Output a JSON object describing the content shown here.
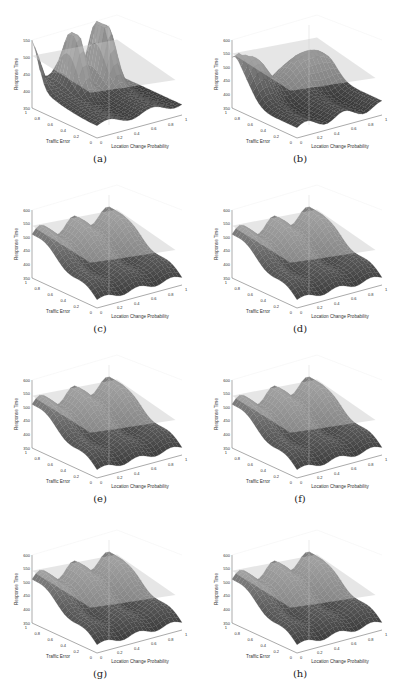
{
  "figure": {
    "panels": [
      {
        "id": "a",
        "caption": "(a)",
        "variant": "two-peaks",
        "x": 0,
        "y": 0
      },
      {
        "id": "b",
        "caption": "(b)",
        "variant": "ridge",
        "x": 200,
        "y": 0
      },
      {
        "id": "c",
        "caption": "(c)",
        "variant": "wavy",
        "x": 0,
        "y": 170
      },
      {
        "id": "d",
        "caption": "(d)",
        "variant": "wavy",
        "x": 200,
        "y": 170
      },
      {
        "id": "e",
        "caption": "(e)",
        "variant": "wavy",
        "x": 0,
        "y": 340
      },
      {
        "id": "f",
        "caption": "(f)",
        "variant": "wavy",
        "x": 200,
        "y": 340
      },
      {
        "id": "g",
        "caption": "(g)",
        "variant": "wavy",
        "x": 0,
        "y": 515
      },
      {
        "id": "h",
        "caption": "(h)",
        "variant": "wavy",
        "x": 200,
        "y": 515
      }
    ]
  },
  "chart_data": [
    {
      "panel": "a",
      "type": "surface",
      "zlabel": "Response Time",
      "ylabel": "Traffic Error",
      "xlabel": "Location Change Probability",
      "zticks": [
        350,
        400,
        450,
        500,
        550
      ],
      "xticks": [
        0,
        0.2,
        0.4,
        0.6,
        0.8,
        1
      ],
      "yticks": [
        0,
        0.2,
        0.4,
        0.6,
        0.8,
        1
      ],
      "zlim": [
        350,
        550
      ],
      "notes": "Two tall peaks near x≈0.3 and x≈0.7 at high traffic error, plus a translucent reference plane at ~480"
    },
    {
      "panel": "b",
      "type": "surface",
      "zlabel": "Response Time",
      "ylabel": "Traffic Error",
      "xlabel": "Location Change Probability",
      "zticks": [
        350,
        400,
        450,
        500,
        550,
        600
      ],
      "xticks": [
        0,
        0.2,
        0.4,
        0.6,
        0.8,
        1
      ],
      "yticks": [
        0,
        0.2,
        0.4,
        0.6,
        0.8,
        1
      ],
      "zlim": [
        350,
        600
      ],
      "notes": "Broad ridge with bumps at high traffic error, reference plane at ~490"
    },
    {
      "panel": "c",
      "type": "surface",
      "zlabel": "Response Time",
      "ylabel": "Traffic Error",
      "xlabel": "Location Change Probability",
      "zticks": [
        350,
        400,
        450,
        500,
        550,
        600
      ],
      "xticks": [
        0,
        0.2,
        0.4,
        0.6,
        0.8,
        1
      ],
      "yticks": [
        0,
        0.2,
        0.4,
        0.6,
        0.8,
        1
      ],
      "zlim": [
        350,
        600
      ],
      "notes": "Wavy sloped surface rising with traffic error, reference plane at ~480"
    },
    {
      "panel": "d",
      "type": "surface",
      "zlabel": "Response Time",
      "ylabel": "Traffic Error",
      "xlabel": "Location Change Probability",
      "zticks": [
        350,
        400,
        450,
        500,
        550,
        600
      ],
      "xticks": [
        0,
        0.2,
        0.4,
        0.6,
        0.8,
        1
      ],
      "yticks": [
        0,
        0.2,
        0.4,
        0.6,
        0.8,
        1
      ],
      "zlim": [
        350,
        600
      ]
    },
    {
      "panel": "e",
      "type": "surface",
      "zlabel": "Response Time",
      "ylabel": "Traffic Error",
      "xlabel": "Location Change Probability",
      "zticks": [
        350,
        400,
        450,
        500,
        550,
        600
      ],
      "xticks": [
        0,
        0.2,
        0.4,
        0.6,
        0.8,
        1
      ],
      "yticks": [
        0,
        0.2,
        0.4,
        0.6,
        0.8,
        1
      ],
      "zlim": [
        350,
        600
      ]
    },
    {
      "panel": "f",
      "type": "surface",
      "zlabel": "Response Time",
      "ylabel": "Traffic Error",
      "xlabel": "Location Change Probability",
      "zticks": [
        350,
        400,
        450,
        500,
        550,
        600
      ],
      "xticks": [
        0,
        0.2,
        0.4,
        0.6,
        0.8,
        1
      ],
      "yticks": [
        0,
        0.2,
        0.4,
        0.6,
        0.8,
        1
      ],
      "zlim": [
        350,
        600
      ]
    },
    {
      "panel": "g",
      "type": "surface",
      "zlabel": "Response Time",
      "ylabel": "Traffic Error",
      "xlabel": "Location Change Probability",
      "zticks": [
        350,
        400,
        450,
        500,
        550,
        600
      ],
      "xticks": [
        0,
        0.2,
        0.4,
        0.6,
        0.8,
        1
      ],
      "yticks": [
        0,
        0.2,
        0.4,
        0.6,
        0.8,
        1
      ],
      "zlim": [
        350,
        600
      ]
    },
    {
      "panel": "h",
      "type": "surface",
      "zlabel": "Response Time",
      "ylabel": "Traffic Error",
      "xlabel": "Location Change Probability",
      "zticks": [
        350,
        400,
        450,
        500,
        550,
        600
      ],
      "xticks": [
        0,
        0.2,
        0.4,
        0.6,
        0.8,
        1
      ],
      "yticks": [
        0,
        0.2,
        0.4,
        0.6,
        0.8,
        1
      ],
      "zlim": [
        350,
        600
      ]
    }
  ]
}
